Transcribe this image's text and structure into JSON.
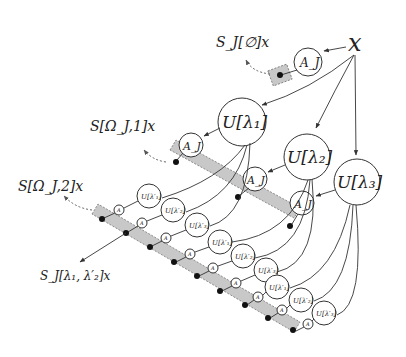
{
  "diagram": {
    "type": "scattering-transform-tree",
    "root": {
      "label": "x"
    },
    "outputs": {
      "order0": "S_J[∅]x",
      "order1": "S[Ω_J,1]x",
      "order2": "S[Ω_J,2]x",
      "example_path": "S_J[λ₁, λ′₂]x"
    },
    "averaging_label": "A_J",
    "small_averaging_label": "A",
    "layer1": [
      {
        "label": "U[λ₁]"
      },
      {
        "label": "U[λ₂]"
      },
      {
        "label": "U[λ₃]"
      }
    ],
    "layer2_labels": [
      "U[λ′₁]",
      "U[λ′₂]",
      "U[λ′₃]"
    ],
    "colors": {
      "band_fill": "#c8c8c8",
      "stroke": "#333333",
      "dot": "#111111"
    }
  }
}
